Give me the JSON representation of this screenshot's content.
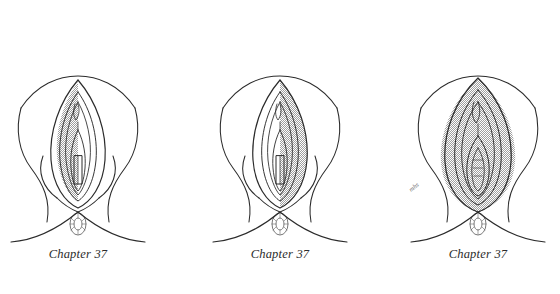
{
  "plate": {
    "background_color": "#ffffff",
    "ink_color": "#2b2b2b",
    "shading_color": "#b9b9b9",
    "panel_count": 3
  },
  "panels": [
    {
      "id": "panel-1",
      "caption": "Chapter 37",
      "shading_side": "left",
      "signature_mark": "",
      "center_x": 78
    },
    {
      "id": "panel-2",
      "caption": "Chapter 37",
      "shading_side": "right",
      "signature_mark": "",
      "center_x": 280
    },
    {
      "id": "panel-3",
      "caption": "Chapter 37",
      "shading_side": "both",
      "signature_mark": "mhs",
      "center_x": 478
    }
  ]
}
